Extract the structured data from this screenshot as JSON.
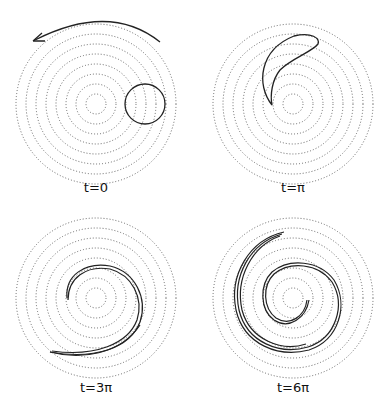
{
  "figure": {
    "panels": [
      {
        "label": "t=0",
        "feature": "circular blob with rotation arrow"
      },
      {
        "label": "t=π",
        "feature": "crescent-shaped stretched blob"
      },
      {
        "label": "t=3π",
        "feature": "spiral filament, ~1 turn"
      },
      {
        "label": "t=6π",
        "feature": "tight spiral filament, ~2 turns"
      }
    ],
    "rings": {
      "count": 8,
      "style": "dotted",
      "color": "#555555"
    },
    "stroke_color": "#222222",
    "icons": {
      "rotation_arrow": "counterclockwise-arrow-icon"
    }
  }
}
